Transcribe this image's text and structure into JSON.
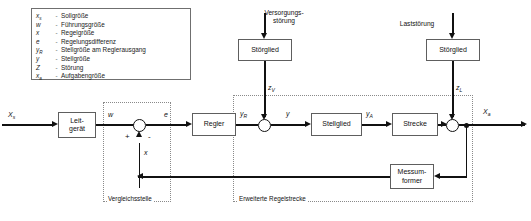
{
  "legend": {
    "rows": [
      {
        "symbol": "x",
        "sub": "s",
        "dash": "-",
        "text": "Sollgröße"
      },
      {
        "symbol": "w",
        "sub": "",
        "dash": "-",
        "text": "Führungsgröße"
      },
      {
        "symbol": "x",
        "sub": "",
        "dash": "-",
        "text": "Regelgröße"
      },
      {
        "symbol": "e",
        "sub": "",
        "dash": "-",
        "text": "Regelungsdifferenz"
      },
      {
        "symbol": "y",
        "sub": "R",
        "dash": "-",
        "text": "Stellgröße am Reglerausgang"
      },
      {
        "symbol": "y",
        "sub": "",
        "dash": "-",
        "text": "Stellgröße"
      },
      {
        "symbol": "Z",
        "sub": "",
        "dash": "-",
        "text": "Störung"
      },
      {
        "symbol": "x",
        "sub": "a",
        "dash": "-",
        "text": "Aufgabengröße"
      }
    ]
  },
  "blocks": {
    "leitgeraet": "Leit-\ngerät",
    "regler": "Regler",
    "stellglied": "Stellglied",
    "strecke": "Strecke",
    "stoerglied_v": "Störglied",
    "stoerglied_l": "Störglied",
    "messumformer": "Messum-\nformer"
  },
  "signals": {
    "xs": "X",
    "xs_sub": "s",
    "w": "w",
    "e": "e",
    "x": "x",
    "yr": "y",
    "yr_sub": "R",
    "y": "y",
    "ya": "y",
    "ya_sub": "A",
    "xa": "X",
    "xa_sub": "a",
    "zv": "z",
    "zv_sub": "V",
    "zl": "z",
    "zl_sub": "L"
  },
  "signs": {
    "plus": "+",
    "minus": "-"
  },
  "captions": {
    "versorgungsstoerung": "Versorgungs-\nstörung",
    "laststoerung": "Laststörung"
  },
  "dotted_labels": {
    "vergleichsstelle": "Vergleichsstelle",
    "erweiterte_regelstrecke": "Erweiterte Regelstrecke"
  },
  "colors": {
    "line": "#111111",
    "block_border": "#5e5e5e",
    "dotted_border": "#8a8a8a",
    "background": "#ffffff"
  }
}
